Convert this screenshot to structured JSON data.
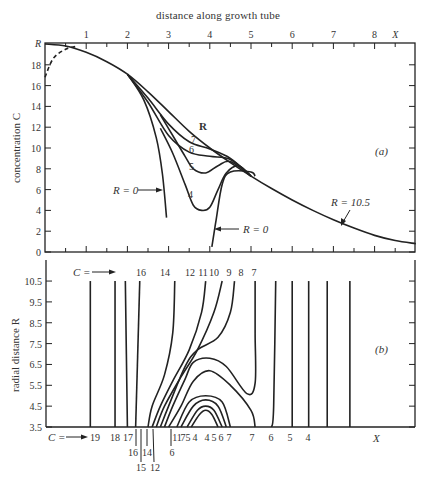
{
  "figure": {
    "top_axis_title": "distance along growth tube",
    "panel_a_label": "(a)",
    "panel_b_label": "(b)"
  },
  "chart_data": [
    {
      "type": "line",
      "panel": "(a)",
      "title": "distance along growth tube",
      "xlabel": "distance along growth tube",
      "ylabel": "concentration C",
      "x_tick_labels": [
        "1",
        "2",
        "3",
        "4",
        "5",
        "6",
        "7",
        "8",
        "X"
      ],
      "x_ticks": [
        1,
        2,
        3,
        4,
        5,
        6,
        7,
        8,
        8.5
      ],
      "y_tick_labels": [
        "0",
        "2",
        "4",
        "6",
        "8",
        "10",
        "12",
        "14",
        "16",
        "18",
        "R"
      ],
      "y_ticks": [
        0,
        2,
        4,
        6,
        8,
        10,
        12,
        14,
        16,
        18,
        20
      ],
      "xlim": [
        0,
        9
      ],
      "ylim": [
        0,
        20
      ],
      "grid": false,
      "legend": "none (inline labels)",
      "series": [
        {
          "name": "R = 10.5",
          "label": "R",
          "points": [
            [
              0,
              20
            ],
            [
              0.5,
              19.8
            ],
            [
              1,
              19.2
            ],
            [
              1.5,
              18.3
            ],
            [
              2,
              17.1
            ],
            [
              2.5,
              15.4
            ],
            [
              3,
              13.5
            ],
            [
              3.5,
              11.6
            ],
            [
              4,
              10
            ],
            [
              4.5,
              8.6
            ],
            [
              5,
              7.3
            ],
            [
              5.5,
              6.1
            ],
            [
              6,
              5
            ],
            [
              6.5,
              4
            ],
            [
              7,
              3.1
            ],
            [
              7.5,
              2.3
            ],
            [
              8,
              1.6
            ],
            [
              8.5,
              1.1
            ],
            [
              9,
              0.8
            ]
          ]
        },
        {
          "name": "R = 7",
          "label": "7",
          "points": [
            [
              2,
              17.1
            ],
            [
              2.5,
              14.8
            ],
            [
              3,
              12.3
            ],
            [
              3.5,
              10.6
            ],
            [
              4,
              9.9
            ],
            [
              4.5,
              9
            ],
            [
              5,
              7.3
            ]
          ]
        },
        {
          "name": "R = 6",
          "label": "6",
          "points": [
            [
              2,
              17.1
            ],
            [
              2.5,
              14.4
            ],
            [
              3,
              11.2
            ],
            [
              3.5,
              9.6
            ],
            [
              4,
              9.2
            ],
            [
              4.5,
              8.9
            ],
            [
              5,
              7.3
            ]
          ]
        },
        {
          "name": "R = 5",
          "label": "5",
          "points": [
            [
              2.8,
              13.2
            ],
            [
              3.1,
              11.2
            ],
            [
              3.4,
              9.2
            ],
            [
              3.6,
              8
            ],
            [
              3.9,
              7.6
            ],
            [
              4.2,
              8.3
            ],
            [
              4.5,
              8.7
            ],
            [
              5,
              7.3
            ]
          ]
        },
        {
          "name": "R = 4",
          "label": "4",
          "points": [
            [
              2.8,
              11.9
            ],
            [
              3.1,
              9.5
            ],
            [
              3.4,
              6.5
            ],
            [
              3.6,
              4.5
            ],
            [
              3.8,
              4
            ],
            [
              4,
              4.3
            ],
            [
              4.2,
              6
            ],
            [
              4.4,
              7.6
            ],
            [
              4.7,
              8.3
            ],
            [
              5,
              7.3
            ]
          ]
        },
        {
          "name": "R = 0 (left)",
          "label": "R = 0",
          "points": [
            [
              2,
              17.1
            ],
            [
              2.4,
              14.6
            ],
            [
              2.7,
              11
            ],
            [
              2.85,
              7.5
            ],
            [
              2.95,
              3.3
            ]
          ]
        },
        {
          "name": "R = 0 (right)",
          "label": "R = 0",
          "points": [
            [
              4.05,
              0.5
            ],
            [
              4.15,
              3
            ],
            [
              4.3,
              6.5
            ],
            [
              4.5,
              7.7
            ],
            [
              5,
              7.7
            ],
            [
              5.1,
              7.3
            ]
          ]
        },
        {
          "name": "dashed boundary",
          "label": "",
          "style": "dashed",
          "points": [
            [
              0,
              16.8
            ],
            [
              0.2,
              18.6
            ],
            [
              0.5,
              19.5
            ],
            [
              0.8,
              19.8
            ]
          ]
        }
      ],
      "annotations": [
        {
          "text": "R = 0",
          "arrow_to": [
            2.95,
            5.8
          ],
          "position": "left"
        },
        {
          "text": "R = 0",
          "arrow_to": [
            4.1,
            2
          ],
          "position": "right"
        },
        {
          "text": "R = 10.5",
          "arrow_to": [
            7.2,
            2.6
          ],
          "position": "above"
        },
        {
          "text": "(a)",
          "position": [
            7.8,
            9.5
          ]
        }
      ]
    },
    {
      "type": "line",
      "panel": "(b)",
      "subtype": "contour",
      "xlabel": "X",
      "ylabel": "radial distance R",
      "y_tick_labels": [
        "3.5",
        "4.5",
        "5.5",
        "6.5",
        "7.5",
        "8.5",
        "9.5",
        "10.5"
      ],
      "y_ticks": [
        3.5,
        4.5,
        5.5,
        6.5,
        7.5,
        8.5,
        9.5,
        10.5
      ],
      "xlim": [
        0,
        9
      ],
      "ylim": [
        3.5,
        11.5
      ],
      "grid": false,
      "top_labels_prefix": "C =",
      "top_contour_labels": [
        "16",
        "14",
        "12",
        "11",
        "10",
        "9",
        "8",
        "7"
      ],
      "bottom_labels_prefix": "C =",
      "bottom_contour_labels": [
        "19",
        "18",
        "17",
        "16",
        "15",
        "14",
        "12",
        "11",
        "7",
        "5",
        "6",
        "4",
        "4",
        "5",
        "6",
        "7",
        "7",
        "6",
        "5",
        "4"
      ],
      "bottom_axis_end_label": "X",
      "contours": [
        {
          "C": 19,
          "points": [
            [
              1.1,
              3.5
            ],
            [
              1.1,
              10.5
            ]
          ]
        },
        {
          "C": 18,
          "points": [
            [
              1.7,
              3.5
            ],
            [
              1.7,
              10.5
            ]
          ]
        },
        {
          "C": 17,
          "points": [
            [
              2.0,
              3.5
            ],
            [
              1.95,
              10.5
            ]
          ]
        },
        {
          "C": 16,
          "points": [
            [
              2.2,
              3.5
            ],
            [
              2.3,
              10.5
            ]
          ]
        },
        {
          "C": 14,
          "points": [
            [
              2.5,
              3.5
            ],
            [
              2.6,
              4.5
            ],
            [
              2.9,
              6
            ],
            [
              3.1,
              8
            ],
            [
              3.15,
              10.5
            ]
          ]
        },
        {
          "C": 12,
          "points": [
            [
              2.6,
              3.5
            ],
            [
              2.8,
              4.5
            ],
            [
              3.1,
              5.7
            ],
            [
              3.5,
              7.2
            ],
            [
              3.8,
              9
            ],
            [
              3.9,
              10.5
            ]
          ]
        },
        {
          "C": 11,
          "points": [
            [
              2.7,
              3.5
            ],
            [
              2.9,
              4.5
            ],
            [
              3.3,
              5.9
            ],
            [
              3.7,
              7.2
            ],
            [
              4.1,
              9
            ],
            [
              4.3,
              10.5
            ]
          ]
        },
        {
          "C": 10,
          "points": [
            [
              2.8,
              3.5
            ],
            [
              3,
              4.5
            ],
            [
              3.4,
              6.4
            ],
            [
              3.7,
              7.2
            ],
            [
              4.2,
              7.8
            ],
            [
              4.5,
              9
            ],
            [
              4.6,
              10.5
            ]
          ]
        },
        {
          "C": 9,
          "points": [
            [
              2.9,
              3.5
            ],
            [
              3.1,
              4.5
            ],
            [
              3.4,
              5.8
            ],
            [
              3.6,
              6.6
            ],
            [
              4,
              6.8
            ],
            [
              4.4,
              6.4
            ],
            [
              4.9,
              5.1
            ],
            [
              5.1,
              5.6
            ],
            [
              5.1,
              8
            ],
            [
              5.1,
              10.5
            ]
          ]
        },
        {
          "C": 8,
          "points": [
            [
              3,
              3.5
            ],
            [
              3.3,
              4.5
            ],
            [
              3.6,
              5.7
            ],
            [
              4,
              6.2
            ],
            [
              4.5,
              5.5
            ],
            [
              5,
              4.3
            ],
            [
              5.1,
              3.5
            ]
          ]
        },
        {
          "C": 7,
          "points": [
            [
              5.5,
              3.5
            ],
            [
              5.55,
              4.5
            ],
            [
              5.6,
              10.5
            ]
          ]
        },
        {
          "C": 6,
          "points": [
            [
              6.0,
              3.5
            ],
            [
              6.0,
              10.5
            ]
          ]
        },
        {
          "C": 5,
          "points": [
            [
              6.4,
              3.5
            ],
            [
              6.4,
              10.5
            ]
          ]
        },
        {
          "C": 4,
          "points": [
            [
              6.85,
              3.5
            ],
            [
              6.85,
              10.5
            ]
          ]
        },
        {
          "C": 3.5,
          "points": [
            [
              7.4,
              3.5
            ],
            [
              7.4,
              10.5
            ]
          ]
        },
        {
          "C": 7,
          "closed_dome": true,
          "points": [
            [
              3.2,
              3.5
            ],
            [
              3.5,
              4.7
            ],
            [
              3.9,
              5
            ],
            [
              4.3,
              4.7
            ],
            [
              4.5,
              3.5
            ]
          ]
        },
        {
          "C": 6,
          "closed_dome": true,
          "points": [
            [
              3.3,
              3.5
            ],
            [
              3.6,
              4.5
            ],
            [
              3.9,
              4.8
            ],
            [
              4.2,
              4.5
            ],
            [
              4.4,
              3.5
            ]
          ]
        },
        {
          "C": 5,
          "closed_dome": true,
          "points": [
            [
              3.45,
              3.5
            ],
            [
              3.7,
              4.3
            ],
            [
              3.9,
              4.5
            ],
            [
              4.1,
              4.3
            ],
            [
              4.3,
              3.5
            ]
          ]
        },
        {
          "C": 4,
          "closed_dome": true,
          "points": [
            [
              3.55,
              3.5
            ],
            [
              3.75,
              4.1
            ],
            [
              3.9,
              4.3
            ],
            [
              4.05,
              4.1
            ],
            [
              4.2,
              3.5
            ]
          ]
        }
      ],
      "annotations": [
        {
          "text": "(b)",
          "position": [
            7.8,
            6.9
          ]
        }
      ]
    }
  ],
  "labels": {
    "a_xticks": [
      "1",
      "2",
      "3",
      "4",
      "5",
      "6",
      "7",
      "8",
      "X"
    ],
    "a_yticks": [
      "0",
      "2",
      "4",
      "6",
      "8",
      "10",
      "12",
      "14",
      "16",
      "18",
      "R"
    ],
    "a_ylabel": "concentration C",
    "a_curve_labels": [
      "R",
      "7",
      "6",
      "5",
      "4"
    ],
    "a_r0_left": "R = 0",
    "a_r0_right": "R = 0",
    "a_r105": "R = 10.5",
    "b_yticks": [
      "10.5",
      "9.5",
      "8.5",
      "7.5",
      "6.5",
      "5.5",
      "4.5",
      "3.5"
    ],
    "b_ylabel": "radial distance R",
    "b_c_prefix_top": "C =",
    "b_top_labels": [
      "16",
      "14",
      "12",
      "11",
      "10",
      "9",
      "8",
      "7"
    ],
    "b_c_prefix_bottom": "C =",
    "b_bottom_row1": [
      "19",
      "18",
      "17",
      "11",
      "7",
      "5",
      "4",
      "4",
      "5",
      "6",
      "7",
      "7",
      "6",
      "5",
      "4"
    ],
    "b_bottom_row2": [
      "16",
      "14",
      "6"
    ],
    "b_bottom_row3": [
      "15",
      "12"
    ],
    "b_x_end": "X"
  }
}
